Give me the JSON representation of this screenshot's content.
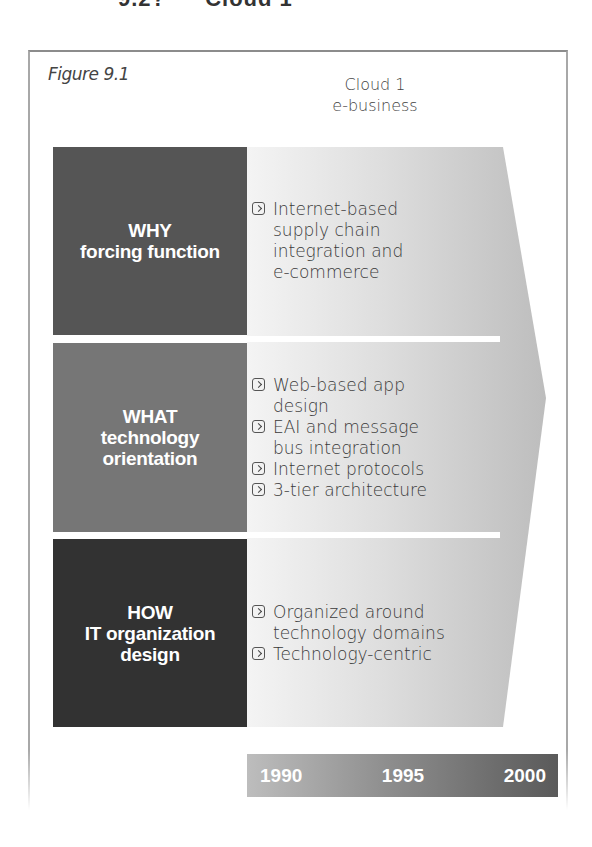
{
  "section_heading": {
    "number": "9.2?",
    "title": "Cloud 1"
  },
  "figure": {
    "label": "Figure 9.1",
    "column_header": "Cloud 1\ne-business",
    "rows": [
      {
        "label_line1": "WHY",
        "label_line2": "forcing function",
        "label_line3": "",
        "color": "#555555",
        "bullets": [
          "Internet-based\nsupply chain\nintegration and\ne-commerce"
        ]
      },
      {
        "label_line1": "WHAT",
        "label_line2": "technology",
        "label_line3": "orientation",
        "color": "#767676",
        "bullets": [
          "Web-based app\ndesign",
          "EAI and message\nbus integration",
          "Internet protocols",
          "3-tier architecture"
        ]
      },
      {
        "label_line1": "HOW",
        "label_line2": "IT organization",
        "label_line3": "design",
        "color": "#323232",
        "bullets": [
          "Organized around\ntechnology domains",
          "Technology-centric"
        ]
      }
    ],
    "timeline": [
      "1990",
      "1995",
      "2000"
    ],
    "bullet_icon": "chevron-right-box-icon"
  }
}
